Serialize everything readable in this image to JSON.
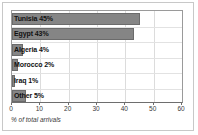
{
  "chart_data": {
    "type": "bar",
    "orientation": "horizontal",
    "title": "",
    "subtitle": "",
    "xlabel": "% of total arrivals",
    "ylabel": "",
    "xlim": [
      0,
      60
    ],
    "xticks": [
      0,
      10,
      20,
      30,
      40,
      50,
      60
    ],
    "grid": true,
    "legend": false,
    "categories": [
      "Tunisia",
      "Egypt",
      "Algeria",
      "Morocco",
      "Iraq",
      "Other"
    ],
    "values": [
      45,
      43,
      4,
      2,
      1,
      5
    ],
    "bar_labels": [
      "Tunisia 45%",
      "Egypt 43%",
      "Algeria 4%",
      "Morocco 2%",
      "Iraq 1%",
      "Other 5%"
    ],
    "colors": {
      "bar_fill": "#858585",
      "bar_border": "#6b6b6b",
      "gridline": "#dcdcdc",
      "axis": "#6e6e6e",
      "plot_background": "#ffffff",
      "frame_border": "#c8c8c8",
      "text": "#111111"
    }
  }
}
